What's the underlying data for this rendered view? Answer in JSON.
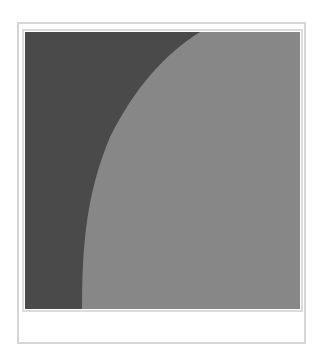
{
  "frame": {
    "border_color": "#d6d6d6",
    "mat_color": "#dcdcdc",
    "background": "#ffffff"
  },
  "picture": {
    "shapes": [
      {
        "name": "dark-region",
        "color": "#4a4a4a"
      },
      {
        "name": "light-curved-region",
        "color": "#878787"
      }
    ]
  }
}
